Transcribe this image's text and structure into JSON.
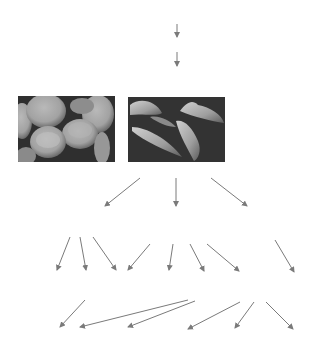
{
  "diagram": {
    "title": "",
    "note": "Flow diagram with text labels removed; contains two micrograph images and arrows.",
    "images": [
      {
        "id": "normal-rbc",
        "description": "Normal red blood cells (biconcave discs) micrograph",
        "x": 18,
        "y": 96,
        "w": 97,
        "h": 66
      },
      {
        "id": "sickle-rbc",
        "description": "Sickle-shaped red blood cells micrograph",
        "x": 128,
        "y": 97,
        "w": 97,
        "h": 65
      }
    ],
    "arrow_color": "#7a7a7a",
    "arrows": [
      {
        "from": [
          177,
          24
        ],
        "to": [
          177,
          37
        ]
      },
      {
        "from": [
          177,
          52
        ],
        "to": [
          177,
          66
        ]
      },
      {
        "from": [
          140,
          178
        ],
        "to": [
          105,
          206
        ]
      },
      {
        "from": [
          176,
          178
        ],
        "to": [
          176,
          206
        ]
      },
      {
        "from": [
          211,
          178
        ],
        "to": [
          247,
          206
        ]
      },
      {
        "from": [
          70,
          237
        ],
        "to": [
          57,
          270
        ]
      },
      {
        "from": [
          80,
          237
        ],
        "to": [
          86,
          270
        ]
      },
      {
        "from": [
          93,
          237
        ],
        "to": [
          116,
          270
        ]
      },
      {
        "from": [
          150,
          244
        ],
        "to": [
          128,
          270
        ]
      },
      {
        "from": [
          173,
          244
        ],
        "to": [
          169,
          270
        ]
      },
      {
        "from": [
          190,
          244
        ],
        "to": [
          204,
          271
        ]
      },
      {
        "from": [
          207,
          244
        ],
        "to": [
          239,
          271
        ]
      },
      {
        "from": [
          275,
          240
        ],
        "to": [
          294,
          272
        ]
      },
      {
        "from": [
          85,
          300
        ],
        "to": [
          60,
          327
        ]
      },
      {
        "from": [
          188,
          300
        ],
        "to": [
          80,
          327
        ]
      },
      {
        "from": [
          195,
          301
        ],
        "to": [
          128,
          327
        ]
      },
      {
        "from": [
          240,
          302
        ],
        "to": [
          188,
          329
        ]
      },
      {
        "from": [
          254,
          302
        ],
        "to": [
          235,
          328
        ]
      },
      {
        "from": [
          266,
          302
        ],
        "to": [
          293,
          329
        ]
      }
    ]
  }
}
